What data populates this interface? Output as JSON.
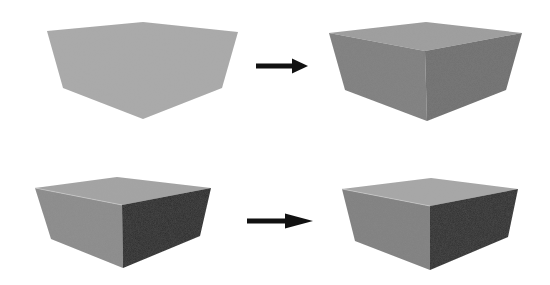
{
  "diagram": {
    "rows": [
      {
        "id": "row-top",
        "before": {
          "label": "flat-silhouette",
          "faces": {
            "top": "#a9a9a9",
            "left": "#a9a9a9",
            "right": "#a9a9a9"
          }
        },
        "arrow": {
          "color": "#111111"
        },
        "after": {
          "label": "shaded-box-soft",
          "faces": {
            "top": "#9d9d9d",
            "left": "#7f7f7f",
            "right": "#6f6f6f"
          }
        }
      },
      {
        "id": "row-bottom",
        "before": {
          "label": "shaded-box-high-contrast",
          "faces": {
            "top": "#a3a3a3",
            "left": "#8b8b8b",
            "right": "#2b2b2b"
          }
        },
        "arrow": {
          "color": "#111111"
        },
        "after": {
          "label": "shaded-box-textured",
          "faces": {
            "top": "#a6a6a6",
            "left": "#808080",
            "right": "#2e2e2e"
          }
        }
      }
    ]
  }
}
